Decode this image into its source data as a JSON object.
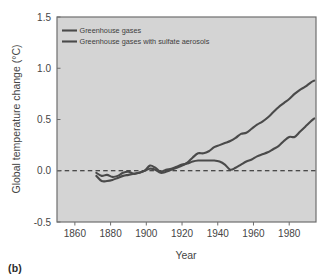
{
  "figure": {
    "panel_caption": "(b)"
  },
  "chart_data": {
    "type": "line",
    "title": "",
    "xlabel": "Year",
    "ylabel": "Global temperature change (°C)",
    "xlim": [
      1850,
      1995
    ],
    "ylim": [
      -0.5,
      1.5
    ],
    "grid": false,
    "legend_position": "top-left-inside",
    "plot_background": "#d4d4d4",
    "frame_color": "#6e6e6e",
    "zero_line": {
      "value": 0.0,
      "style": "dashed",
      "color": "#1c1c1c"
    },
    "xticks": [
      1860,
      1880,
      1900,
      1920,
      1940,
      1960,
      1980
    ],
    "xtick_labels": [
      "1860",
      "1880",
      "1900",
      "1920",
      "1940",
      "1960",
      "1980"
    ],
    "yticks": [
      -0.5,
      0.0,
      0.5,
      1.0,
      1.5
    ],
    "ytick_labels": [
      "-0.5",
      "0.0",
      "0.5",
      "1.0",
      "1.5"
    ],
    "series": [
      {
        "name": "Greenhouse gases",
        "color": "#4a4a4a",
        "x": [
          1872,
          1875,
          1878,
          1881,
          1884,
          1887,
          1890,
          1893,
          1896,
          1899,
          1902,
          1905,
          1908,
          1911,
          1914,
          1917,
          1920,
          1923,
          1926,
          1929,
          1932,
          1935,
          1938,
          1941,
          1944,
          1947,
          1950,
          1953,
          1956,
          1959,
          1962,
          1965,
          1968,
          1971,
          1974,
          1977,
          1980,
          1983,
          1986,
          1989,
          1992,
          1994
        ],
        "y": [
          -0.02,
          -0.05,
          -0.04,
          -0.06,
          -0.05,
          -0.02,
          -0.01,
          -0.03,
          -0.02,
          0.0,
          0.02,
          0.01,
          -0.02,
          -0.01,
          0.01,
          0.03,
          0.05,
          0.08,
          0.13,
          0.17,
          0.17,
          0.19,
          0.23,
          0.25,
          0.27,
          0.29,
          0.32,
          0.36,
          0.37,
          0.41,
          0.45,
          0.48,
          0.52,
          0.57,
          0.62,
          0.66,
          0.7,
          0.75,
          0.79,
          0.82,
          0.86,
          0.88
        ]
      },
      {
        "name": "Greenhouse gases with sulfate aerosols",
        "color": "#4a4a4a",
        "x": [
          1872,
          1875,
          1878,
          1881,
          1884,
          1887,
          1890,
          1893,
          1896,
          1899,
          1902,
          1905,
          1908,
          1911,
          1914,
          1917,
          1920,
          1923,
          1926,
          1929,
          1932,
          1935,
          1938,
          1941,
          1944,
          1947,
          1950,
          1953,
          1956,
          1959,
          1962,
          1965,
          1968,
          1971,
          1974,
          1977,
          1980,
          1983,
          1986,
          1989,
          1992,
          1994
        ],
        "y": [
          -0.05,
          -0.1,
          -0.1,
          -0.09,
          -0.07,
          -0.05,
          -0.04,
          -0.03,
          -0.02,
          0.0,
          0.05,
          0.03,
          -0.01,
          0.01,
          0.02,
          0.04,
          0.06,
          0.07,
          0.09,
          0.1,
          0.1,
          0.1,
          0.1,
          0.09,
          0.06,
          0.01,
          0.03,
          0.06,
          0.09,
          0.11,
          0.14,
          0.16,
          0.18,
          0.21,
          0.24,
          0.29,
          0.33,
          0.33,
          0.38,
          0.43,
          0.48,
          0.51
        ]
      }
    ]
  }
}
